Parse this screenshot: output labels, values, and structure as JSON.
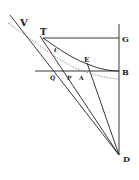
{
  "diagram": {
    "type": "geometric figure",
    "colors": {
      "ink": "#222222",
      "dotted": "#777777",
      "background": "#ffffff"
    },
    "labels": {
      "V": "V",
      "T": "T",
      "G": "G",
      "E": "E",
      "B": "B",
      "Q": "Q",
      "P": "P",
      "A": "A",
      "D": "D",
      "t": "t"
    }
  }
}
